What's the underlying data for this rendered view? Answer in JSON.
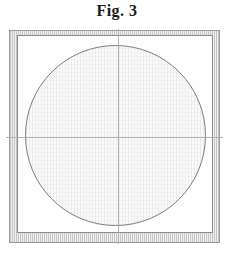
{
  "figure": {
    "title": "Fig. 3",
    "elements": {
      "outer_frame": "double-border square frame with fine vertical hatch band",
      "inner_frame": "inner square border",
      "circle": "large inscribed circle with light stipple fill",
      "centerlines": "horizontal and vertical centerlines crossing at circle center"
    }
  },
  "colors": {
    "background": "#ffffff",
    "title_text": "#1a1a1a",
    "outer_border": "#9a9a9a",
    "inner_border": "#8a8a8a",
    "circle_stroke": "#7d7d7d",
    "crosshair": "#b2b2b2",
    "hatch_band": "#c6c6c6",
    "stipple_fill": "#fafafa"
  }
}
